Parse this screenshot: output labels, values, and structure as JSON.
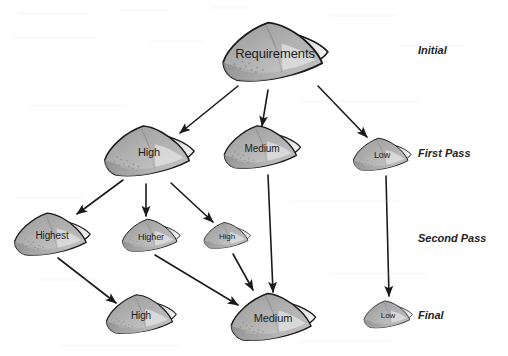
{
  "diagram": {
    "background_color": "#ffffff",
    "edge_color": "#1a1a1a",
    "node_outline_color": "#1a1a1a",
    "node_fill_dark": "#8a8a8a",
    "node_fill_mid": "#a8a8a8",
    "node_fill_light": "#d9d9d9",
    "node_fill_highlight": "#ebebeb",
    "label_text_color": "#1c1c1c",
    "stage_text_color": "#232323"
  },
  "stages": [
    {
      "id": "stage-initial",
      "label": "Initial",
      "x": 418,
      "y": 50,
      "font_size": 11
    },
    {
      "id": "stage-first-pass",
      "label": "First Pass",
      "x": 418,
      "y": 153,
      "font_size": 11
    },
    {
      "id": "stage-second-pass",
      "label": "Second Pass",
      "x": 418,
      "y": 238,
      "font_size": 11
    },
    {
      "id": "stage-final",
      "label": "Final",
      "x": 418,
      "y": 315,
      "font_size": 11
    }
  ],
  "nodes": [
    {
      "id": "node-requirements",
      "label": "Requirements",
      "x": 275,
      "y": 53,
      "w": 115,
      "h": 72,
      "font_size": 13,
      "stage": "Initial"
    },
    {
      "id": "node-high-first",
      "label": "High",
      "x": 149,
      "y": 152,
      "w": 96,
      "h": 62,
      "font_size": 11,
      "stage": "First Pass"
    },
    {
      "id": "node-medium-first",
      "label": "Medium",
      "x": 262,
      "y": 148,
      "w": 82,
      "h": 53,
      "font_size": 10,
      "stage": "First Pass"
    },
    {
      "id": "node-low-first",
      "label": "Low",
      "x": 382,
      "y": 155,
      "w": 62,
      "h": 40,
      "font_size": 9,
      "stage": "First Pass"
    },
    {
      "id": "node-highest",
      "label": "Highest",
      "x": 52,
      "y": 235,
      "w": 82,
      "h": 52,
      "font_size": 10,
      "stage": "Second Pass"
    },
    {
      "id": "node-higher",
      "label": "Higher",
      "x": 151,
      "y": 236,
      "w": 62,
      "h": 41,
      "font_size": 9,
      "stage": "Second Pass"
    },
    {
      "id": "node-high-second",
      "label": "High",
      "x": 227,
      "y": 236,
      "w": 50,
      "h": 34,
      "font_size": 8,
      "stage": "Second Pass"
    },
    {
      "id": "node-high-final",
      "label": "High",
      "x": 141,
      "y": 315,
      "w": 76,
      "h": 48,
      "font_size": 10,
      "stage": "Final"
    },
    {
      "id": "node-medium-final",
      "label": "Medium",
      "x": 273,
      "y": 318,
      "w": 92,
      "h": 58,
      "font_size": 11,
      "stage": "Final"
    },
    {
      "id": "node-low-final",
      "label": "Low",
      "x": 388,
      "y": 315,
      "w": 52,
      "h": 34,
      "font_size": 8,
      "stage": "Final"
    }
  ],
  "edges": [
    {
      "id": "edge-requirements-high",
      "from": "Requirements",
      "to": "High",
      "x1": 238,
      "y1": 86,
      "x2": 180,
      "y2": 133
    },
    {
      "id": "edge-requirements-medium",
      "from": "Requirements",
      "to": "Medium",
      "x1": 268,
      "y1": 90,
      "x2": 262,
      "y2": 126
    },
    {
      "id": "edge-requirements-low",
      "from": "Requirements",
      "to": "Low",
      "x1": 318,
      "y1": 86,
      "x2": 367,
      "y2": 137
    },
    {
      "id": "edge-high-highest",
      "from": "High",
      "to": "Highest",
      "x1": 123,
      "y1": 180,
      "x2": 77,
      "y2": 214
    },
    {
      "id": "edge-high-higher",
      "from": "High",
      "to": "Higher",
      "x1": 146,
      "y1": 184,
      "x2": 146,
      "y2": 216
    },
    {
      "id": "edge-high-high2",
      "from": "High",
      "to": "High",
      "x1": 171,
      "y1": 183,
      "x2": 213,
      "y2": 222
    },
    {
      "id": "edge-medium-medium",
      "from": "Medium",
      "to": "Medium",
      "x1": 268,
      "y1": 175,
      "x2": 273,
      "y2": 292
    },
    {
      "id": "edge-low-low",
      "from": "Low",
      "to": "Low",
      "x1": 386,
      "y1": 176,
      "x2": 389,
      "y2": 296
    },
    {
      "id": "edge-highest-high",
      "from": "Highest",
      "to": "High",
      "x1": 58,
      "y1": 258,
      "x2": 116,
      "y2": 303
    },
    {
      "id": "edge-higher-medium",
      "from": "Higher",
      "to": "Medium",
      "x1": 155,
      "y1": 255,
      "x2": 238,
      "y2": 305
    },
    {
      "id": "edge-high2-medium",
      "from": "High",
      "to": "Medium",
      "x1": 233,
      "y1": 254,
      "x2": 253,
      "y2": 290
    }
  ]
}
